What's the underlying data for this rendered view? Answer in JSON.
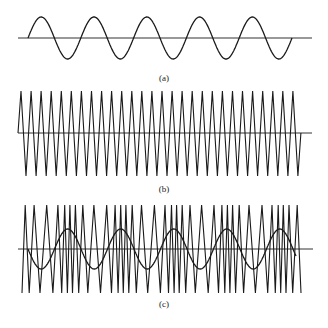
{
  "figure": {
    "panels": [
      {
        "id": "a",
        "label": "(a)",
        "label_pos": [
          164,
          73
        ],
        "description": "modulating sine wave",
        "baseline": {
          "x1": 18,
          "x2": 312,
          "y": 38
        },
        "sine": {
          "x_start": 28,
          "x_end": 292,
          "amplitude": 21,
          "period": 52.8,
          "phase_up_first": true
        }
      },
      {
        "id": "b",
        "label": "(b)",
        "label_pos": [
          164,
          184
        ],
        "description": "carrier triangle wave",
        "baseline": {
          "x1": 18,
          "x2": 312,
          "y": 133
        },
        "triangle": {
          "x_start": 18,
          "first_peak": 21,
          "period": 10.07,
          "count": 28,
          "top": 91,
          "bottom": 176
        }
      },
      {
        "id": "c",
        "label": "(c)",
        "label_pos": [
          164,
          299
        ],
        "description": "frequency-modulated triangle wave with overlaid modulating sine",
        "baseline": {
          "x1": 18,
          "x2": 313,
          "y": 249
        },
        "sine": {
          "x_start": 28,
          "x_end": 296,
          "amplitude": 20,
          "period": 53,
          "phase_up_first": false
        },
        "fm": {
          "x_start": 22,
          "x_end": 301,
          "top": 205,
          "bottom": 293,
          "base_period": 9.2,
          "deviation": 0.45
        }
      }
    ],
    "line_color": "#1a1a1a",
    "axis_color": "#333333"
  }
}
